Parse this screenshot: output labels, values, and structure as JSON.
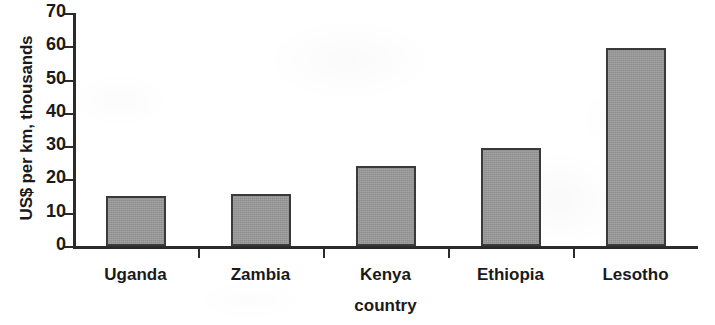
{
  "chart_data": {
    "type": "bar",
    "title": "",
    "subtitle": "",
    "xlabel": "country",
    "ylabel": "US$ per km, thousands",
    "categories": [
      "Uganda",
      "Zambia",
      "Kenya",
      "Ethiopia",
      "Lesotho"
    ],
    "values": [
      15,
      15.5,
      24,
      29.5,
      59.5
    ],
    "series": [
      {
        "name": "US$ per km, thousands",
        "values": [
          15,
          15.5,
          24,
          29.5,
          59.5
        ]
      }
    ],
    "ylim": [
      0,
      70
    ],
    "xlim": [
      0,
      5
    ],
    "y_ticks": [
      0,
      10,
      20,
      30,
      40,
      50,
      60,
      70
    ],
    "y_tick_labels": [
      "0",
      "10",
      "20",
      "30",
      "40",
      "50",
      "60",
      "70"
    ],
    "grid": false,
    "legend": null,
    "legend_position": "none",
    "annotations": [],
    "colors": {
      "bar_fill": "#9b9b9b",
      "bar_border": "#3a3a3a",
      "axis": "#2b2b2b",
      "text": "#1a1a1a",
      "background": "#ffffff"
    }
  }
}
